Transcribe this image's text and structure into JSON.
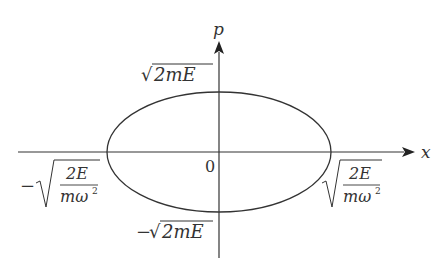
{
  "diagram": {
    "type": "phase-space ellipse",
    "axes": {
      "x_label": "x",
      "y_label": "p",
      "origin_label": "0"
    },
    "ellipse": {
      "p_max_label": "√2mE",
      "p_min_label": "−√2mE",
      "x_max_label": "√(2E/mω²)",
      "x_min_label": "−√(2E/mω²)"
    },
    "parts": {
      "sqrt": "√",
      "minus": "−",
      "two_m_E": "2mE",
      "numerator": "2E",
      "denominator_base": "mω",
      "denominator_exp": "2"
    },
    "colors": {
      "stroke": "#333333",
      "background": "#ffffff"
    }
  }
}
